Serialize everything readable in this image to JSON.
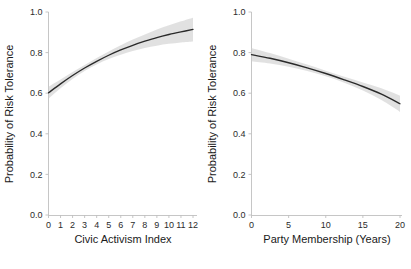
{
  "figure": {
    "background_color": "#ffffff",
    "line_color": "#2a2a2a",
    "band_color": "#cfcfcf",
    "axis_color": "#bfbfbf",
    "footer_fragment": ""
  },
  "chart_data": [
    {
      "type": "line",
      "title": "",
      "xlabel": "Civic Activism Index",
      "ylabel": "Probability of Risk Tolerance",
      "xlim": [
        0,
        12
      ],
      "ylim": [
        0.0,
        1.0
      ],
      "grid": false,
      "legend": "none",
      "xticks": [
        0,
        1,
        2,
        3,
        4,
        5,
        6,
        7,
        8,
        9,
        10,
        11,
        12
      ],
      "xticklabels": [
        "0",
        "1",
        "2",
        "3",
        "4",
        "5",
        "6",
        "7",
        "8",
        "9",
        "10",
        "11",
        "12"
      ],
      "yticks": [
        0.0,
        0.2,
        0.4,
        0.6,
        0.8,
        1.0
      ],
      "yticklabels": [
        "0.0",
        "0.2",
        "0.4",
        "0.6",
        "0.8",
        "1.0"
      ],
      "series": [
        {
          "name": "Predicted probability",
          "x": [
            0,
            1,
            2,
            3,
            4,
            5,
            6,
            7,
            8,
            9,
            10,
            11,
            12
          ],
          "values": [
            0.602,
            0.646,
            0.687,
            0.724,
            0.757,
            0.787,
            0.813,
            0.836,
            0.856,
            0.874,
            0.889,
            0.902,
            0.914
          ],
          "ci_lower": [
            0.572,
            0.624,
            0.67,
            0.709,
            0.741,
            0.768,
            0.79,
            0.808,
            0.823,
            0.834,
            0.843,
            0.85,
            0.855
          ],
          "ci_upper": [
            0.632,
            0.668,
            0.704,
            0.739,
            0.773,
            0.806,
            0.836,
            0.864,
            0.889,
            0.914,
            0.935,
            0.954,
            0.972
          ]
        }
      ]
    },
    {
      "type": "line",
      "title": "",
      "xlabel": "Party Membership (Years)",
      "ylabel": "Probability of Risk Tolerance",
      "xlim": [
        0,
        20
      ],
      "ylim": [
        0.0,
        1.0
      ],
      "grid": false,
      "legend": "none",
      "xticks": [
        0,
        5,
        10,
        15,
        20
      ],
      "xticklabels": [
        "0",
        "5",
        "10",
        "15",
        "20"
      ],
      "yticks": [
        0.0,
        0.2,
        0.4,
        0.6,
        0.8,
        1.0
      ],
      "yticklabels": [
        "0.0",
        "0.2",
        "0.4",
        "0.6",
        "0.8",
        "1.0"
      ],
      "series": [
        {
          "name": "Predicted probability",
          "x": [
            0,
            2.5,
            5,
            7.5,
            10,
            12.5,
            15,
            17.5,
            20
          ],
          "values": [
            0.79,
            0.772,
            0.75,
            0.725,
            0.697,
            0.666,
            0.633,
            0.595,
            0.548
          ],
          "ci_lower": [
            0.757,
            0.746,
            0.73,
            0.709,
            0.683,
            0.651,
            0.613,
            0.566,
            0.508
          ],
          "ci_upper": [
            0.823,
            0.798,
            0.77,
            0.741,
            0.711,
            0.681,
            0.653,
            0.624,
            0.588
          ]
        }
      ]
    }
  ]
}
